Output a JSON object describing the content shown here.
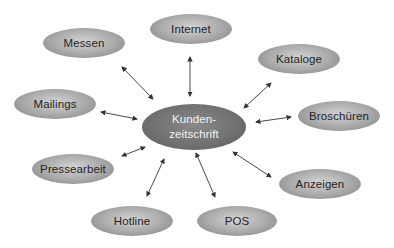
{
  "diagram": {
    "center": {
      "line1": "Kunden-",
      "line2": "zeitschrift"
    },
    "nodes": [
      {
        "label": "Messen"
      },
      {
        "label": "Internet"
      },
      {
        "label": "Kataloge"
      },
      {
        "label": "Mailings"
      },
      {
        "label": "Broschüren"
      },
      {
        "label": "Pressearbeit"
      },
      {
        "label": "Anzeigen"
      },
      {
        "label": "Hotline"
      },
      {
        "label": "POS"
      }
    ],
    "arrow_style": "bidirectional"
  }
}
